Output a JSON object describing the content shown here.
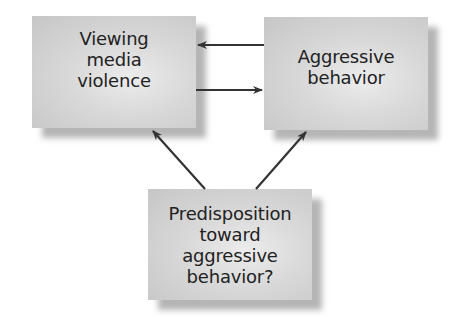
{
  "diagram": {
    "nodes": [
      {
        "id": "media",
        "label": "Viewing\nmedia\nviolence"
      },
      {
        "id": "aggression",
        "label": "Aggressive\nbehavior"
      },
      {
        "id": "predisposition",
        "label": "Predisposition\ntoward\naggressive\nbehavior?"
      }
    ],
    "edges": [
      {
        "from": "aggression",
        "to": "media"
      },
      {
        "from": "media",
        "to": "aggression"
      },
      {
        "from": "predisposition",
        "to": "media"
      },
      {
        "from": "predisposition",
        "to": "aggression"
      }
    ],
    "colors": {
      "box": "#d4d4d4",
      "arrow": "#333333",
      "text": "#222222"
    }
  }
}
